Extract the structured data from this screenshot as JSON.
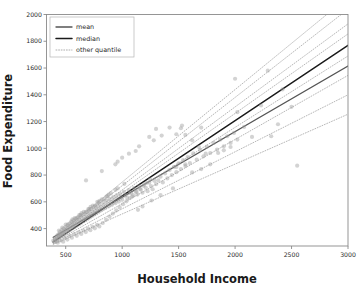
{
  "chart_data": {
    "type": "scatter",
    "title": "",
    "xlabel": "Household Income",
    "ylabel": "Food Expenditure",
    "xlim": [
      330,
      3000
    ],
    "ylim": [
      270,
      2000
    ],
    "xticks": [
      500,
      1000,
      1500,
      2000,
      2500,
      3000
    ],
    "xticklabels": [
      "500",
      "1000",
      "1500",
      "2000",
      "2500",
      "3000"
    ],
    "yticks": [
      400,
      600,
      800,
      1000,
      1200,
      1400,
      1600,
      1800,
      2000
    ],
    "yticklabels": [
      "400",
      "600",
      "800",
      "1000",
      "1200",
      "1400",
      "1600",
      "1800",
      "2000"
    ],
    "grid": false,
    "legend_position": "upper left",
    "legend": [
      {
        "label": "mean",
        "style": "solid",
        "color": "#555555",
        "linewidth": 1.3
      },
      {
        "label": "median",
        "style": "solid",
        "color": "#1b1b1b",
        "linewidth": 1.5
      },
      {
        "label": "other quantile",
        "style": "dotted",
        "color": "#9a9a9a",
        "linewidth": 0.8
      }
    ],
    "scatter": {
      "color": "#9e9e9e",
      "alpha": 0.45,
      "marker": "o",
      "size": 4.2,
      "points": [
        [
          390,
          310
        ],
        [
          400,
          300
        ],
        [
          405,
          325
        ],
        [
          412,
          318
        ],
        [
          418,
          340
        ],
        [
          422,
          305
        ],
        [
          428,
          352
        ],
        [
          433,
          330
        ],
        [
          440,
          360
        ],
        [
          445,
          342
        ],
        [
          450,
          375
        ],
        [
          455,
          355
        ],
        [
          460,
          348
        ],
        [
          465,
          390
        ],
        [
          470,
          370
        ],
        [
          475,
          358
        ],
        [
          480,
          400
        ],
        [
          486,
          382
        ],
        [
          492,
          365
        ],
        [
          498,
          412
        ],
        [
          504,
          395
        ],
        [
          510,
          378
        ],
        [
          516,
          425
        ],
        [
          522,
          405
        ],
        [
          528,
          388
        ],
        [
          534,
          438
        ],
        [
          540,
          418
        ],
        [
          546,
          400
        ],
        [
          552,
          448
        ],
        [
          558,
          430
        ],
        [
          564,
          412
        ],
        [
          570,
          462
        ],
        [
          576,
          442
        ],
        [
          582,
          422
        ],
        [
          588,
          472
        ],
        [
          594,
          455
        ],
        [
          600,
          435
        ],
        [
          608,
          485
        ],
        [
          616,
          468
        ],
        [
          624,
          448
        ],
        [
          632,
          498
        ],
        [
          640,
          478
        ],
        [
          648,
          458
        ],
        [
          656,
          510
        ],
        [
          664,
          490
        ],
        [
          672,
          470
        ],
        [
          680,
          522
        ],
        [
          688,
          502
        ],
        [
          696,
          482
        ],
        [
          704,
          535
        ],
        [
          712,
          514
        ],
        [
          720,
          494
        ],
        [
          728,
          548
        ],
        [
          736,
          526
        ],
        [
          744,
          506
        ],
        [
          752,
          560
        ],
        [
          760,
          538
        ],
        [
          768,
          518
        ],
        [
          776,
          572
        ],
        [
          784,
          550
        ],
        [
          792,
          530
        ],
        [
          800,
          585
        ],
        [
          810,
          562
        ],
        [
          820,
          542
        ],
        [
          830,
          598
        ],
        [
          840,
          575
        ],
        [
          850,
          554
        ],
        [
          860,
          610
        ],
        [
          870,
          588
        ],
        [
          880,
          566
        ],
        [
          890,
          622
        ],
        [
          900,
          600
        ],
        [
          910,
          578
        ],
        [
          920,
          635
        ],
        [
          930,
          612
        ],
        [
          940,
          590
        ],
        [
          950,
          648
        ],
        [
          960,
          625
        ],
        [
          970,
          602
        ],
        [
          980,
          660
        ],
        [
          990,
          638
        ],
        [
          1000,
          615
        ],
        [
          1015,
          675
        ],
        [
          1030,
          650
        ],
        [
          1045,
          628
        ],
        [
          1060,
          688
        ],
        [
          1075,
          664
        ],
        [
          1090,
          640
        ],
        [
          1105,
          702
        ],
        [
          1120,
          678
        ],
        [
          1135,
          654
        ],
        [
          1150,
          716
        ],
        [
          1165,
          692
        ],
        [
          1180,
          668
        ],
        [
          1195,
          730
        ],
        [
          1210,
          705
        ],
        [
          1225,
          680
        ],
        [
          1240,
          744
        ],
        [
          1255,
          718
        ],
        [
          1270,
          694
        ],
        [
          1285,
          758
        ],
        [
          1300,
          732
        ],
        [
          1320,
          760
        ],
        [
          1340,
          788
        ],
        [
          1360,
          745
        ],
        [
          1380,
          812
        ],
        [
          1400,
          775
        ],
        [
          1420,
          838
        ],
        [
          1440,
          800
        ],
        [
          1460,
          862
        ],
        [
          1480,
          822
        ],
        [
          1500,
          888
        ],
        [
          1520,
          845
        ],
        [
          1540,
          912
        ],
        [
          1560,
          868
        ],
        [
          1580,
          935
        ],
        [
          1600,
          890
        ],
        [
          1630,
          962
        ],
        [
          1660,
          915
        ],
        [
          1690,
          988
        ],
        [
          1720,
          940
        ],
        [
          1750,
          1012
        ],
        [
          1780,
          965
        ],
        [
          1810,
          1040
        ],
        [
          1840,
          990
        ],
        [
          1870,
          1065
        ],
        [
          1900,
          1015
        ],
        [
          1930,
          1090
        ],
        [
          1960,
          1040
        ],
        [
          1990,
          1115
        ],
        [
          2020,
          1065
        ],
        [
          620,
          500
        ],
        [
          700,
          545
        ],
        [
          780,
          600
        ],
        [
          860,
          640
        ],
        [
          940,
          690
        ],
        [
          1020,
          735
        ],
        [
          560,
          470
        ],
        [
          640,
          515
        ],
        [
          720,
          562
        ],
        [
          800,
          608
        ],
        [
          880,
          655
        ],
        [
          960,
          700
        ],
        [
          500,
          430
        ],
        [
          580,
          478
        ],
        [
          660,
          525
        ],
        [
          740,
          572
        ],
        [
          820,
          618
        ],
        [
          900,
          665
        ],
        [
          470,
          408
        ],
        [
          550,
          455
        ],
        [
          630,
          502
        ],
        [
          710,
          548
        ],
        [
          790,
          595
        ],
        [
          870,
          642
        ],
        [
          440,
          385
        ],
        [
          520,
          432
        ],
        [
          600,
          480
        ],
        [
          680,
          526
        ],
        [
          760,
          572
        ],
        [
          840,
          620
        ],
        [
          680,
          760
        ],
        [
          820,
          830
        ],
        [
          960,
          900
        ],
        [
          1120,
          980
        ],
        [
          1280,
          1060
        ],
        [
          940,
          880
        ],
        [
          1000,
          930
        ],
        [
          1060,
          960
        ],
        [
          1150,
          1015
        ],
        [
          1240,
          1085
        ],
        [
          1300,
          1145
        ],
        [
          1350,
          1095
        ],
        [
          1420,
          1155
        ],
        [
          1480,
          1105
        ],
        [
          1530,
          1170
        ],
        [
          1480,
          860
        ],
        [
          1560,
          880
        ],
        [
          1620,
          820
        ],
        [
          1700,
          845
        ],
        [
          1780,
          880
        ],
        [
          1850,
          965
        ],
        [
          1900,
          985
        ],
        [
          1960,
          1010
        ],
        [
          2000,
          1520
        ],
        [
          2020,
          1270
        ],
        [
          2080,
          1160
        ],
        [
          2150,
          1085
        ],
        [
          2230,
          1320
        ],
        [
          2290,
          1580
        ],
        [
          2320,
          1090
        ],
        [
          2380,
          1180
        ],
        [
          2420,
          1440
        ],
        [
          2500,
          1310
        ],
        [
          2550,
          870
        ],
        [
          1700,
          1155
        ],
        [
          1520,
          1150
        ],
        [
          1560,
          1100
        ],
        [
          1620,
          1060
        ],
        [
          1680,
          1010
        ],
        [
          1740,
          960
        ],
        [
          1140,
          540
        ],
        [
          1180,
          565
        ],
        [
          1260,
          610
        ],
        [
          1340,
          650
        ],
        [
          1450,
          700
        ],
        [
          430,
          295
        ],
        [
          455,
          312
        ],
        [
          478,
          302
        ],
        [
          495,
          330
        ],
        [
          515,
          318
        ],
        [
          535,
          345
        ],
        [
          555,
          332
        ],
        [
          578,
          358
        ],
        [
          598,
          346
        ],
        [
          618,
          372
        ],
        [
          638,
          360
        ],
        [
          658,
          386
        ],
        [
          678,
          374
        ],
        [
          698,
          400
        ],
        [
          718,
          388
        ],
        [
          738,
          414
        ],
        [
          758,
          402
        ],
        [
          778,
          428
        ],
        [
          798,
          416
        ],
        [
          828,
          442
        ],
        [
          858,
          466
        ],
        [
          888,
          490
        ],
        [
          918,
          512
        ],
        [
          948,
          536
        ],
        [
          978,
          558
        ],
        [
          1008,
          582
        ],
        [
          1038,
          604
        ],
        [
          1068,
          628
        ],
        [
          1098,
          650
        ],
        [
          1128,
          674
        ],
        [
          1158,
          696
        ],
        [
          1188,
          720
        ],
        [
          1218,
          742
        ],
        [
          1248,
          766
        ]
      ]
    },
    "lines": [
      {
        "name": "median",
        "style": "solid",
        "color": "#1b1b1b",
        "linewidth": 1.5,
        "x": [
          390,
          3000
        ],
        "y": [
          300,
          1770
        ]
      },
      {
        "name": "mean",
        "style": "solid",
        "color": "#555555",
        "linewidth": 1.3,
        "x": [
          390,
          3000
        ],
        "y": [
          335,
          1615
        ]
      },
      {
        "name": "q05",
        "style": "dotted",
        "color": "#a5a5a5",
        "linewidth": 0.8,
        "x": [
          390,
          3000
        ],
        "y": [
          282,
          1255
        ]
      },
      {
        "name": "q10",
        "style": "dotted",
        "color": "#a5a5a5",
        "linewidth": 0.8,
        "x": [
          390,
          3000
        ],
        "y": [
          288,
          1400
        ]
      },
      {
        "name": "q25",
        "style": "dotted",
        "color": "#a5a5a5",
        "linewidth": 0.8,
        "x": [
          390,
          3000
        ],
        "y": [
          294,
          1545
        ]
      },
      {
        "name": "q40",
        "style": "dotted",
        "color": "#a5a5a5",
        "linewidth": 0.8,
        "x": [
          390,
          3000
        ],
        "y": [
          298,
          1690
        ]
      },
      {
        "name": "q60",
        "style": "dotted",
        "color": "#a5a5a5",
        "linewidth": 0.8,
        "x": [
          390,
          3000
        ],
        "y": [
          304,
          1855
        ]
      },
      {
        "name": "q75",
        "style": "dotted",
        "color": "#a5a5a5",
        "linewidth": 0.8,
        "x": [
          390,
          3000
        ],
        "y": [
          310,
          1930
        ]
      },
      {
        "name": "q90",
        "style": "dotted",
        "color": "#a5a5a5",
        "linewidth": 0.8,
        "x": [
          390,
          3000
        ],
        "y": [
          318,
          2040
        ]
      },
      {
        "name": "q95",
        "style": "dotted",
        "color": "#a5a5a5",
        "linewidth": 0.8,
        "x": [
          390,
          3000
        ],
        "y": [
          326,
          2130
        ]
      }
    ]
  }
}
